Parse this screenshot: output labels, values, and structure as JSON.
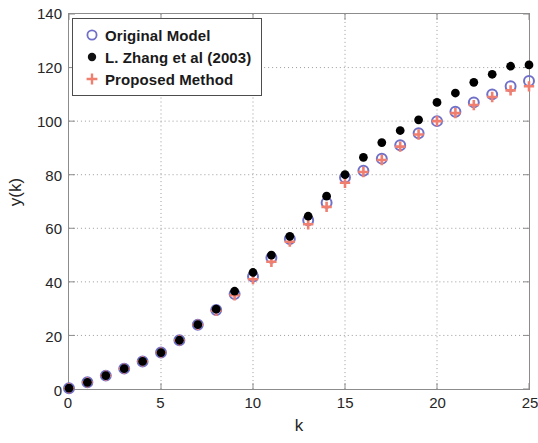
{
  "chart_data": {
    "type": "scatter",
    "title": "",
    "xlabel": "k",
    "ylabel": "y(k)",
    "xlim": [
      0,
      25
    ],
    "ylim": [
      0,
      140
    ],
    "xticks": [
      0,
      5,
      10,
      15,
      20,
      25
    ],
    "yticks": [
      0,
      20,
      40,
      60,
      80,
      100,
      120,
      140
    ],
    "grid": true,
    "legend_position": "upper left",
    "x": [
      0,
      1,
      2,
      3,
      4,
      5,
      6,
      7,
      8,
      9,
      10,
      11,
      12,
      13,
      14,
      15,
      16,
      17,
      18,
      19,
      20,
      21,
      22,
      23,
      24,
      25
    ],
    "series": [
      {
        "name": "Original Model",
        "marker": "circle-open",
        "color": "#7070c8",
        "values": [
          0.3,
          2.5,
          5.0,
          7.6,
          10.3,
          13.6,
          18.2,
          24.0,
          29.5,
          35.5,
          42.0,
          49.0,
          56.0,
          63.0,
          69.5,
          79.0,
          81.5,
          86.0,
          91.0,
          95.5,
          100.0,
          103.5,
          107.0,
          110.0,
          113.0,
          115.0
        ]
      },
      {
        "name": "L. Zhang et al (2003)",
        "marker": "circle-filled",
        "color": "#000000",
        "values": [
          0.3,
          2.5,
          5.0,
          7.6,
          10.3,
          13.6,
          18.2,
          24.0,
          29.8,
          36.5,
          43.5,
          50.0,
          57.0,
          64.5,
          72.0,
          80.0,
          86.5,
          92.0,
          96.5,
          100.5,
          107.0,
          110.5,
          114.5,
          117.5,
          120.5,
          121.0
        ]
      },
      {
        "name": "Proposed Method",
        "marker": "plus",
        "color": "#f07f70",
        "values": [
          0.3,
          2.5,
          5.0,
          7.6,
          10.3,
          13.6,
          18.2,
          24.0,
          29.2,
          35.0,
          41.0,
          47.5,
          55.0,
          61.5,
          68.0,
          77.0,
          81.0,
          85.5,
          90.5,
          95.0,
          100.0,
          103.0,
          106.0,
          109.0,
          111.5,
          113.0
        ]
      }
    ]
  },
  "legend": {
    "items": [
      {
        "label": "Original Model"
      },
      {
        "label": "L. Zhang et al (2003)"
      },
      {
        "label": "Proposed Method"
      }
    ]
  },
  "colors": {
    "original_model": "#7070c8",
    "zhang": "#000000",
    "proposed": "#f07f70",
    "grid": "#9a9a9a",
    "axis": "#8c8c8c",
    "text": "#262626"
  }
}
